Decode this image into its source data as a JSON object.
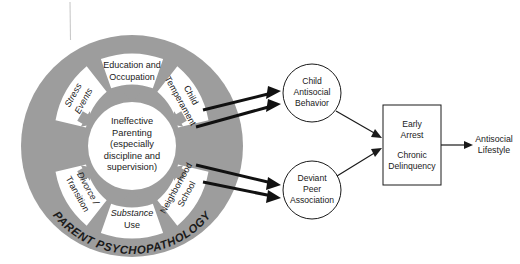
{
  "diagram": {
    "wheel": {
      "ring_label": "PARENT PSYCHOPATHOLOGY",
      "hub_lines": [
        "Ineffective",
        "Parenting",
        "(especially",
        "discipline and",
        "supervision)"
      ],
      "sectors": [
        {
          "id": "education-occupation",
          "lines": [
            "Education and",
            "Occupation"
          ]
        },
        {
          "id": "child-temperament",
          "lines": [
            "Child",
            "Temperament"
          ]
        },
        {
          "id": "neighborhood-school",
          "lines": [
            "Neighborhood",
            "School"
          ]
        },
        {
          "id": "substance-use",
          "lines": [
            "Substance",
            "Use"
          ]
        },
        {
          "id": "divorce-transition",
          "lines": [
            "Divorce /",
            "Transition"
          ]
        },
        {
          "id": "stress-events",
          "lines": [
            "Stress",
            "Events"
          ]
        }
      ]
    },
    "nodes": [
      {
        "id": "child-antisocial-behavior",
        "shape": "circle",
        "lines": [
          "Child",
          "Antisocial",
          "Behavior"
        ]
      },
      {
        "id": "deviant-peer-association",
        "shape": "circle",
        "lines": [
          "Deviant",
          "Peer",
          "Association"
        ]
      },
      {
        "id": "early-arrest-chronic-delinquency",
        "shape": "rect",
        "lines": [
          "Early",
          "Arrest",
          "Chronic",
          "Delinquency"
        ]
      },
      {
        "id": "antisocial-lifestyle",
        "shape": "text",
        "lines": [
          "Antisocial",
          "Lifestyle"
        ]
      }
    ],
    "colors": {
      "ring_gray": "#9d9d9d",
      "stroke_black": "#1a1a1a",
      "background": "#ffffff"
    }
  }
}
